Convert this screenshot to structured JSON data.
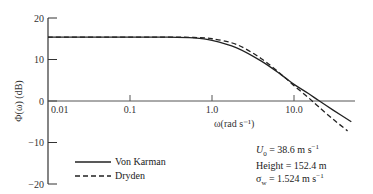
{
  "chart_data": {
    "type": "line",
    "title": "",
    "xlabel": "ω(rad s⁻¹)",
    "ylabel": "Φ(ω) (dB)",
    "xscale": "log",
    "xlim": [
      0.01,
      57
    ],
    "ylim": [
      -20,
      20
    ],
    "x_ticks": [
      "0.01",
      "0.1",
      "1.0",
      "10.0"
    ],
    "y_ticks": [
      "20",
      "10",
      "0",
      "−10",
      "−20"
    ],
    "grid": false,
    "legend_position": "lower left",
    "series": [
      {
        "name": "Von Karman",
        "style": "solid",
        "points": [
          [
            0.01,
            15.4
          ],
          [
            0.1,
            15.4
          ],
          [
            0.3,
            15.4
          ],
          [
            0.6,
            15.2
          ],
          [
            1.0,
            14.6
          ],
          [
            2.0,
            12.8
          ],
          [
            4.0,
            9.6
          ],
          [
            7.0,
            6.3
          ],
          [
            10.0,
            4.0
          ],
          [
            15.0,
            1.8
          ],
          [
            20.0,
            0.1
          ],
          [
            30.0,
            -2.2
          ],
          [
            50.0,
            -5.0
          ]
        ]
      },
      {
        "name": "Dryden",
        "style": "dashed",
        "points": [
          [
            0.01,
            15.4
          ],
          [
            0.1,
            15.4
          ],
          [
            0.3,
            15.4
          ],
          [
            0.6,
            15.3
          ],
          [
            1.0,
            15.0
          ],
          [
            2.0,
            13.6
          ],
          [
            4.0,
            10.2
          ],
          [
            7.0,
            6.4
          ],
          [
            10.0,
            3.7
          ],
          [
            15.0,
            0.8
          ],
          [
            20.0,
            -1.4
          ],
          [
            30.0,
            -4.4
          ],
          [
            45.0,
            -7.2
          ]
        ]
      }
    ],
    "annotations": [
      "U₀ = 38.6 m s⁻¹",
      "Height = 152.4 m",
      "σᵤ = 1.524 m s⁻¹"
    ]
  },
  "legend": {
    "von_karman": "Von Karman",
    "dryden": "Dryden"
  },
  "annotation": {
    "u0": "U",
    "u0_sub": "0",
    "u0_val": " = 38.6 m s",
    "u0_exp": "−1",
    "height": "Height = 152.4 m",
    "sigma": "σ",
    "sigma_sub": "w",
    "sigma_val": " = 1.524 m s",
    "sigma_exp": "−1"
  }
}
